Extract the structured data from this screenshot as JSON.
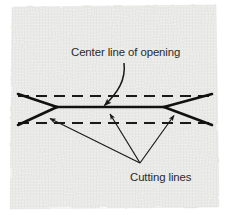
{
  "figure": {
    "kind": "sewing-pattern-diagram",
    "background_color": "#e8e8e6",
    "paper_color": "#e9e9e7",
    "ink_color": "#1a1a1a",
    "text_color": "#2a2a2a",
    "canvas": {
      "width": 228,
      "height": 215
    }
  },
  "labels": {
    "center_line": "Center line of opening",
    "cutting_lines": "Cutting lines"
  },
  "geometry": {
    "center_line": {
      "name": "center-line-of-opening",
      "style": "solid",
      "x1": 57,
      "y1": 107,
      "x2": 164,
      "y2": 107
    },
    "dashed_lines": [
      {
        "name": "upper-stitch-line",
        "style": "dashed",
        "x1": 18,
        "y1": 96,
        "x2": 212,
        "y2": 96
      },
      {
        "name": "lower-stitch-line",
        "style": "dashed",
        "x1": 18,
        "y1": 123,
        "x2": 212,
        "y2": 123
      }
    ],
    "cutting_lines": [
      {
        "name": "cut-upper-left",
        "x1": 18,
        "y1": 94,
        "x2": 57,
        "y2": 107
      },
      {
        "name": "cut-lower-left",
        "x1": 18,
        "y1": 125,
        "x2": 57,
        "y2": 107
      },
      {
        "name": "cut-upper-right",
        "x1": 212,
        "y1": 94,
        "x2": 164,
        "y2": 107
      },
      {
        "name": "cut-lower-right",
        "x1": 212,
        "y1": 125,
        "x2": 164,
        "y2": 107
      }
    ],
    "leader_center": {
      "name": "center-line-leader",
      "from_x": 122,
      "from_y": 64,
      "to_x": 104,
      "to_y": 106,
      "curved": true
    },
    "leader_cutting_origin": {
      "x": 140,
      "y": 164
    },
    "leader_cutting_targets": [
      {
        "name": "cutting-leader-left",
        "x": 49,
        "y": 118
      },
      {
        "name": "cutting-leader-middle",
        "x": 110,
        "y": 114
      },
      {
        "name": "cutting-leader-right",
        "x": 174,
        "y": 115
      }
    ]
  }
}
